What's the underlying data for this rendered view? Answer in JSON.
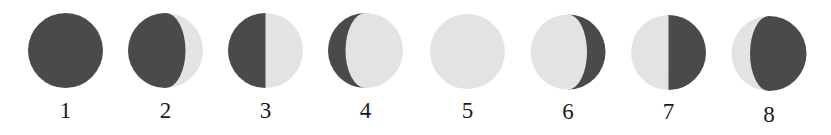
{
  "diagram": {
    "colors": {
      "dark": "#4a4a4a",
      "light": "#e3e3e3",
      "label": "#1a1a1a",
      "background": "#ffffff"
    },
    "radius": 37.5,
    "phases": [
      {
        "label": "1",
        "cx": 65.5,
        "cy": 50.5,
        "label_y": 118,
        "dark_side": "full",
        "terminator": 0
      },
      {
        "label": "2",
        "cx": 165.5,
        "cy": 50.5,
        "label_y": 118,
        "dark_side": "left",
        "terminator": 20
      },
      {
        "label": "3",
        "cx": 265.5,
        "cy": 50.5,
        "label_y": 118,
        "dark_side": "left",
        "terminator": 0
      },
      {
        "label": "4",
        "cx": 365.5,
        "cy": 50.5,
        "label_y": 118,
        "dark_side": "left",
        "terminator": -20
      },
      {
        "label": "5",
        "cx": 467.5,
        "cy": 51.5,
        "label_y": 118,
        "dark_side": "none",
        "terminator": 0
      },
      {
        "label": "6",
        "cx": 568,
        "cy": 52,
        "label_y": 119,
        "dark_side": "right",
        "terminator": 19
      },
      {
        "label": "7",
        "cx": 668.5,
        "cy": 52.5,
        "label_y": 119,
        "dark_side": "right",
        "terminator": 0
      },
      {
        "label": "8",
        "cx": 769,
        "cy": 53.5,
        "label_y": 122,
        "dark_side": "right",
        "terminator": -19
      }
    ]
  }
}
